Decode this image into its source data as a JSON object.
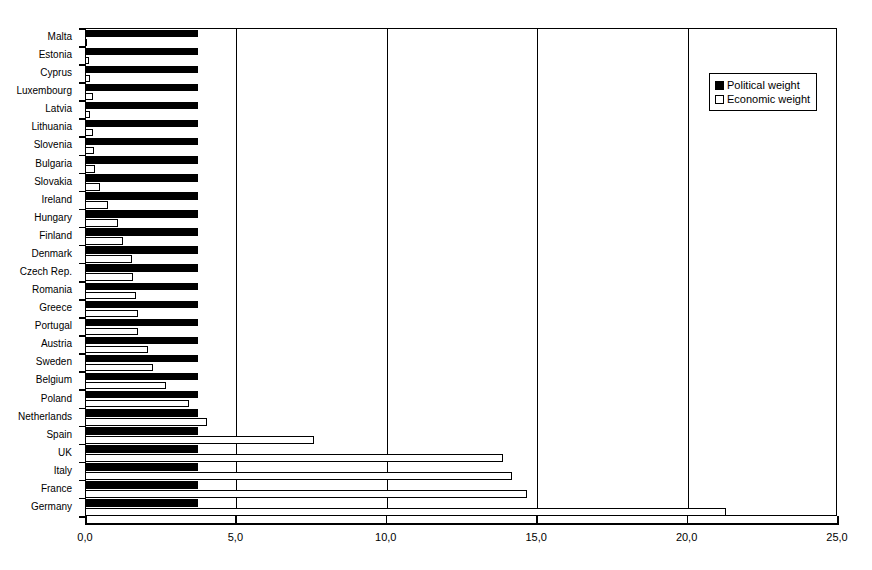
{
  "chart_data": {
    "type": "bar",
    "orientation": "horizontal",
    "title": "",
    "subtitle": "",
    "xlabel": "",
    "ylabel": "",
    "xlim": [
      0.0,
      25.0
    ],
    "xticks": [
      0.0,
      5.0,
      10.0,
      15.0,
      20.0,
      25.0
    ],
    "xticklabels": [
      "0,0",
      "5,0",
      "10,0",
      "15,0",
      "20,0",
      "25,0"
    ],
    "grid": "vertical",
    "legend_position": "top-right",
    "categories": [
      "Malta",
      "Estonia",
      "Cyprus",
      "Luxembourg",
      "Latvia",
      "Lithuania",
      "Slovenia",
      "Bulgaria",
      "Slovakia",
      "Ireland",
      "Hungary",
      "Finland",
      "Denmark",
      "Czech Rep.",
      "Romania",
      "Greece",
      "Portugal",
      "Austria",
      "Sweden",
      "Belgium",
      "Poland",
      "Netherlands",
      "Spain",
      "UK",
      "Italy",
      "France",
      "Germany"
    ],
    "series": [
      {
        "name": "Political weight",
        "color": "#000000",
        "style": "filled",
        "values": [
          3.75,
          3.75,
          3.75,
          3.75,
          3.75,
          3.75,
          3.75,
          3.75,
          3.75,
          3.75,
          3.75,
          3.75,
          3.75,
          3.75,
          3.75,
          3.75,
          3.75,
          3.75,
          3.75,
          3.75,
          3.75,
          3.75,
          3.75,
          3.75,
          3.75,
          3.75,
          3.75
        ]
      },
      {
        "name": "Economic weight",
        "color": "#ffffff",
        "style": "hollow",
        "values": [
          0.05,
          0.12,
          0.15,
          0.27,
          0.18,
          0.28,
          0.3,
          0.33,
          0.5,
          0.75,
          1.1,
          1.25,
          1.55,
          1.6,
          1.7,
          1.75,
          1.75,
          2.1,
          2.25,
          2.7,
          3.45,
          4.05,
          7.6,
          13.9,
          14.2,
          14.7,
          21.3
        ]
      }
    ]
  },
  "legend": {
    "items": [
      {
        "label": "Political weight",
        "swatch": "filled-square-black"
      },
      {
        "label": "Economic weight",
        "swatch": "hollow-square-white"
      }
    ]
  }
}
